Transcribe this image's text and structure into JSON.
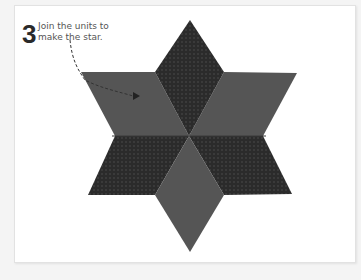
{
  "step": {
    "number": "3",
    "text": "Join the units to make the star."
  },
  "figure": {
    "diamonds": [
      {
        "position": "top",
        "fabric": "dark-dotted"
      },
      {
        "position": "upper-left",
        "fabric": "plain-grey"
      },
      {
        "position": "upper-right",
        "fabric": "plain-grey"
      },
      {
        "position": "lower-left",
        "fabric": "dark-dotted"
      },
      {
        "position": "lower-right",
        "fabric": "dark-dotted"
      },
      {
        "position": "bottom",
        "fabric": "plain-grey"
      }
    ],
    "colors": {
      "plain": "#555555",
      "dotted_base": "#2b2b2b",
      "dot": "#4a4a4a",
      "card": "#ffffff",
      "page": "#f4f4f4"
    }
  }
}
